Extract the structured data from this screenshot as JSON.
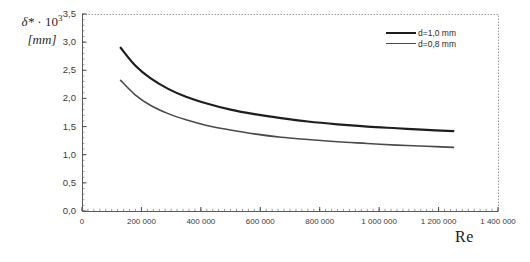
{
  "chart_data": {
    "type": "line",
    "title": "",
    "ylabel_line1": "δ* · 10³",
    "ylabel_line1_base": "δ*",
    "ylabel_line1_mult": " · 10",
    "ylabel_line1_exp": "3",
    "ylabel_line2": "[mm]",
    "xlabel": "Re",
    "grid": false,
    "legend_position": "top-right",
    "xlim": [
      0,
      1400000
    ],
    "ylim": [
      0.0,
      3.5
    ],
    "x_ticks": [
      0,
      200000,
      400000,
      600000,
      800000,
      1000000,
      1200000,
      1400000
    ],
    "x_tick_labels": [
      "0",
      "200 000",
      "400 000",
      "600 000",
      "800 000",
      "1 000 000",
      "1 200 000",
      "1 400 000"
    ],
    "y_ticks": [
      0.0,
      0.5,
      1.0,
      1.5,
      2.0,
      2.5,
      3.0,
      3.5
    ],
    "y_tick_labels": [
      "0,0",
      "0,5",
      "1,0",
      "1,5",
      "2,0",
      "2,5",
      "3,0",
      "3,5"
    ],
    "x_minor_tick_step": 20000,
    "y_minor_tick_step": 0.1,
    "series": [
      {
        "name": "d=1,0 mm",
        "color": "#1d1d1d",
        "width": 2.2,
        "x": [
          130000,
          180000,
          230000,
          290000,
          350000,
          420000,
          500000,
          580000,
          670000,
          760000,
          860000,
          960000,
          1060000,
          1160000,
          1250000
        ],
        "values": [
          2.9,
          2.58,
          2.36,
          2.17,
          2.03,
          1.91,
          1.8,
          1.72,
          1.65,
          1.59,
          1.54,
          1.5,
          1.47,
          1.44,
          1.42
        ]
      },
      {
        "name": "d=0,8 mm",
        "color": "#4a4a4a",
        "width": 1.6,
        "x": [
          130000,
          180000,
          230000,
          290000,
          350000,
          420000,
          500000,
          580000,
          670000,
          760000,
          860000,
          960000,
          1060000,
          1160000,
          1250000
        ],
        "values": [
          2.32,
          2.06,
          1.88,
          1.73,
          1.62,
          1.52,
          1.44,
          1.37,
          1.31,
          1.27,
          1.23,
          1.2,
          1.17,
          1.15,
          1.13
        ]
      }
    ]
  },
  "plot_frame": {
    "left": 82,
    "right": 498,
    "top": 14,
    "bottom": 211,
    "border_color": "#9a9a9a"
  }
}
